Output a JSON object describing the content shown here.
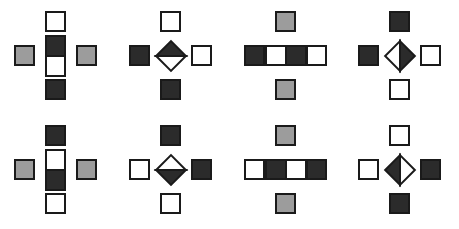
{
  "figure": {
    "panel_count": 8,
    "rows": 2,
    "columns": 4,
    "background_color": "#ffffff",
    "colors": {
      "dark": "#2b2b2b",
      "white": "#ffffff",
      "gray": "#9c9c9c",
      "outline": "#1a1a1a"
    }
  },
  "panels": [
    {
      "id": "panel-1",
      "row": 1,
      "column": 1,
      "x": 0,
      "y": 0,
      "center_type": "split-rect",
      "center_orientation": "vertical-stack",
      "center_size": "21x42",
      "center_parts": [
        {
          "position": "top",
          "fill": "dark"
        },
        {
          "position": "bottom",
          "fill": "white"
        }
      ],
      "satellites": {
        "top": "white",
        "bottom": "dark",
        "left": "gray",
        "right": "gray"
      }
    },
    {
      "id": "panel-2",
      "row": 1,
      "column": 2,
      "x": 115,
      "y": 0,
      "center_type": "diamond",
      "center_orientation": "rotated-45",
      "center_size": "42x42",
      "center_parts": [
        {
          "position": "upper-right",
          "fill": "dark"
        },
        {
          "position": "lower-left",
          "fill": "white"
        }
      ],
      "satellites": {
        "top": "white",
        "bottom": "dark",
        "left": "dark",
        "right": "white"
      }
    },
    {
      "id": "panel-3",
      "row": 1,
      "column": 3,
      "x": 230,
      "y": 0,
      "center_type": "split-rect",
      "center_orientation": "horizontal-pair",
      "center_size": "42x21",
      "center_parts": [
        {
          "position": "left",
          "fill": "white"
        },
        {
          "position": "right",
          "fill": "dark"
        }
      ],
      "satellites": {
        "top": "gray",
        "bottom": "gray",
        "left": "dark",
        "right": "white"
      }
    },
    {
      "id": "panel-4",
      "row": 1,
      "column": 4,
      "x": 344,
      "y": 0,
      "center_type": "diamond",
      "center_orientation": "rotated-45",
      "center_size": "42x42",
      "center_parts": [
        {
          "position": "upper-left",
          "fill": "white"
        },
        {
          "position": "lower-right",
          "fill": "dark"
        }
      ],
      "satellites": {
        "top": "dark",
        "bottom": "white",
        "left": "dark",
        "right": "white"
      }
    },
    {
      "id": "panel-5",
      "row": 2,
      "column": 1,
      "x": 0,
      "y": 114,
      "center_type": "split-rect",
      "center_orientation": "vertical-stack",
      "center_size": "21x42",
      "center_parts": [
        {
          "position": "top",
          "fill": "white"
        },
        {
          "position": "bottom",
          "fill": "dark"
        }
      ],
      "satellites": {
        "top": "dark",
        "bottom": "white",
        "left": "gray",
        "right": "gray"
      }
    },
    {
      "id": "panel-6",
      "row": 2,
      "column": 2,
      "x": 115,
      "y": 114,
      "center_type": "diamond",
      "center_orientation": "rotated-45",
      "center_size": "42x42",
      "center_parts": [
        {
          "position": "upper-right",
          "fill": "white"
        },
        {
          "position": "lower-left",
          "fill": "dark"
        }
      ],
      "satellites": {
        "top": "dark",
        "bottom": "white",
        "left": "white",
        "right": "dark"
      }
    },
    {
      "id": "panel-7",
      "row": 2,
      "column": 3,
      "x": 230,
      "y": 114,
      "center_type": "split-rect",
      "center_orientation": "horizontal-pair",
      "center_size": "42x21",
      "center_parts": [
        {
          "position": "left",
          "fill": "dark"
        },
        {
          "position": "right",
          "fill": "white"
        }
      ],
      "satellites": {
        "top": "gray",
        "bottom": "gray",
        "left": "white",
        "right": "dark"
      }
    },
    {
      "id": "panel-8",
      "row": 2,
      "column": 4,
      "x": 344,
      "y": 114,
      "center_type": "diamond",
      "center_orientation": "rotated-45",
      "center_size": "42x42",
      "center_parts": [
        {
          "position": "upper-left",
          "fill": "dark"
        },
        {
          "position": "lower-right",
          "fill": "white"
        }
      ],
      "satellites": {
        "top": "white",
        "bottom": "dark",
        "left": "white",
        "right": "dark"
      }
    }
  ]
}
